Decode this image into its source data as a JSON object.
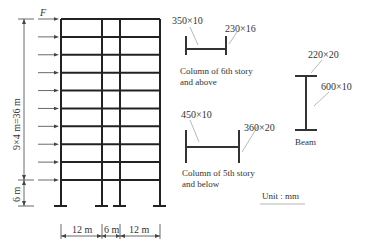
{
  "frame": {
    "load_label": "F",
    "stories_above": 9,
    "story_height_label": "9×4 m=36 m",
    "base_story_label": "6 m",
    "bays": [
      "12 m",
      "6 m",
      "12 m"
    ]
  },
  "sections": {
    "upper_column": {
      "web": "350×10",
      "flange": "230×16",
      "caption_line1": "Column of 6th story",
      "caption_line2": "and above"
    },
    "lower_column": {
      "web": "450×10",
      "flange": "360×20",
      "caption_line1": "Column of 5th story",
      "caption_line2": "and below"
    },
    "beam": {
      "flange": "220×20",
      "web": "600×10",
      "caption": "Beam"
    }
  },
  "unit_label": "Unit : mm"
}
